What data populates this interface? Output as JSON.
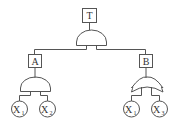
{
  "diagram": {
    "type": "fault-tree",
    "top_event": {
      "label": "T",
      "gate": "AND"
    },
    "intermediate_events": [
      {
        "label": "A",
        "gate": "AND",
        "inputs": [
          {
            "base": "X",
            "sub": "1"
          },
          {
            "base": "X",
            "sub": "2"
          }
        ]
      },
      {
        "label": "B",
        "gate": "OR",
        "inputs": [
          {
            "base": "X",
            "sub": "1"
          },
          {
            "base": "X",
            "sub": "3"
          }
        ]
      }
    ]
  }
}
